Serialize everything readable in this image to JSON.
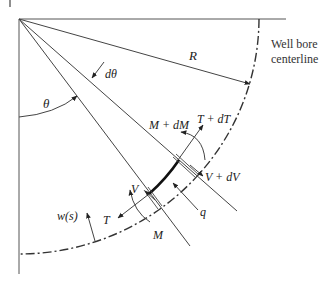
{
  "diagram": {
    "type": "free-body diagram of curved drill pipe element in well bore",
    "labels": {
      "R": "R",
      "theta": "θ",
      "dtheta": "dθ",
      "M_dM": "M + dM",
      "T_dT": "T + dT",
      "V_dV": "V + dV",
      "V": "V",
      "T": "T",
      "M": "M",
      "q": "q",
      "w_s": "w(s)"
    },
    "caption_line1": "Well bore",
    "caption_line2": "centerline",
    "colors": {
      "line": "#444444",
      "thick_segment": "#111111",
      "text": "#222222"
    }
  }
}
